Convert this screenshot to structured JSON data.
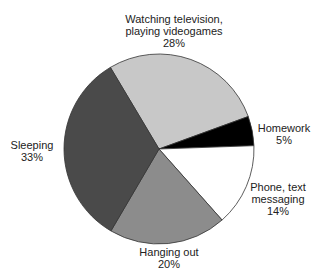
{
  "chart_data": {
    "type": "pie",
    "title": "",
    "categories": [
      "Watching television, playing videogames",
      "Homework",
      "Phone, text messaging",
      "Hanging out",
      "Sleeping"
    ],
    "values": [
      28,
      5,
      14,
      20,
      33
    ],
    "unit": "%",
    "colors": [
      "#c8c8c8",
      "#000000",
      "#ffffff",
      "#8c8c8c",
      "#4a4a4a"
    ],
    "slices": [
      {
        "label_lines": [
          "Watching television,",
          "playing videogames"
        ],
        "value": 28,
        "value_text": "28%",
        "color": "#c8c8c8"
      },
      {
        "label_lines": [
          "Homework"
        ],
        "value": 5,
        "value_text": "5%",
        "color": "#000000"
      },
      {
        "label_lines": [
          "Phone, text",
          "messaging"
        ],
        "value": 14,
        "value_text": "14%",
        "color": "#ffffff"
      },
      {
        "label_lines": [
          "Hanging out"
        ],
        "value": 20,
        "value_text": "20%",
        "color": "#8c8c8c"
      },
      {
        "label_lines": [
          "Sleeping"
        ],
        "value": 33,
        "value_text": "33%",
        "color": "#4a4a4a"
      }
    ],
    "legend": "none (labels placed beside slices)"
  }
}
